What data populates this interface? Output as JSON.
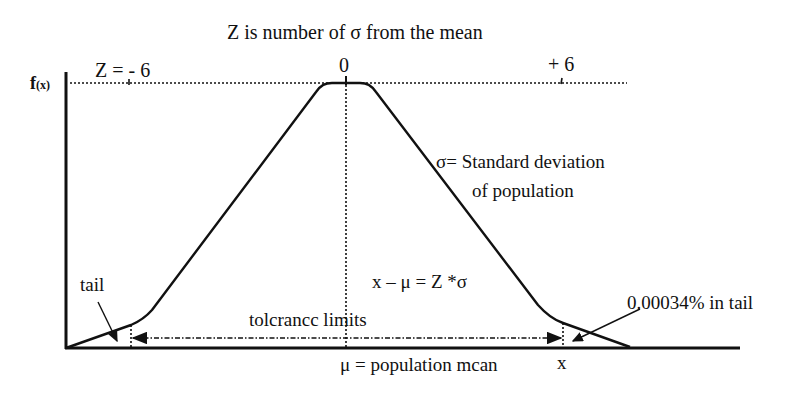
{
  "title": "Z is number of σ from the mean",
  "y_axis_label": "f",
  "y_axis_label_sub": "(x)",
  "ticks": {
    "left": "Z = - 6",
    "center": "0",
    "right": "+ 6"
  },
  "annotations": {
    "sigma_line1": "σ=  Standard deviation",
    "sigma_line2": "of population",
    "formula": "x – μ = Z *σ",
    "tail_left": "tail",
    "tail_right": "0.00034% in tail",
    "tolerance": "tolcrancc limits",
    "mean": "μ  = population mcan",
    "x_marker": "x"
  },
  "colors": {
    "line": "#111111",
    "background": "#ffffff"
  }
}
